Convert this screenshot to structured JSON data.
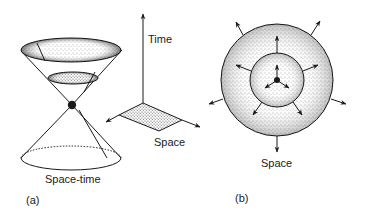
{
  "panel_a": {
    "label": "(a)",
    "caption": "Space-time",
    "axes": {
      "vertical_label": "Time",
      "horizontal_label": "Space"
    }
  },
  "panel_b": {
    "label": "(b)",
    "caption": "Space"
  },
  "colors": {
    "ink": "#1a1a1a",
    "background": "#ffffff"
  }
}
